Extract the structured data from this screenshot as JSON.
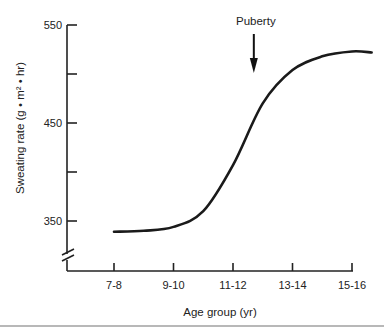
{
  "chart_data": {
    "type": "line",
    "title": "",
    "xlabel": "Age group (yr)",
    "ylabel": "Sweating rate (g • m² • hr)",
    "categories": [
      "7-8",
      "9-10",
      "11-12",
      "13-14",
      "15-16"
    ],
    "x_extent": [
      0,
      4.35
    ],
    "ylim": [
      320,
      550
    ],
    "yticks": [
      350,
      400,
      450,
      500,
      550
    ],
    "ytick_labels": [
      "350",
      "",
      "450",
      "",
      "550"
    ],
    "axis_break": "y",
    "grid": false,
    "legend": null,
    "series": [
      {
        "name": "Sweating rate",
        "x": [
          0,
          0.5,
          1,
          1.5,
          2,
          2.5,
          3,
          3.5,
          4,
          4.33
        ],
        "values": [
          339,
          340,
          344,
          360,
          407,
          470,
          504,
          518,
          523,
          522
        ]
      }
    ],
    "annotations": [
      {
        "text": "Puberty",
        "type": "arrow-down",
        "x": 2.35
      }
    ]
  }
}
